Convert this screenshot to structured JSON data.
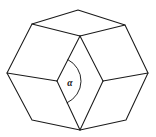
{
  "figure": {
    "kind": "line-drawing",
    "background_color": "#ffffff",
    "stroke_color": "#1a1a1a",
    "width": 156,
    "height": 137,
    "angle": {
      "symbol": "α",
      "label_x": 70,
      "label_y": 86,
      "vertex_name": "inner-left"
    },
    "vertices": {
      "top_apex": {
        "x": 78,
        "y": 10
      },
      "upper_left": {
        "x": 32,
        "y": 24
      },
      "upper_right": {
        "x": 125,
        "y": 25
      },
      "center_top": {
        "x": 80,
        "y": 36
      },
      "outer_left": {
        "x": 7,
        "y": 73
      },
      "outer_right": {
        "x": 148,
        "y": 73
      },
      "inner_left": {
        "x": 57,
        "y": 81
      },
      "inner_right": {
        "x": 103,
        "y": 81
      },
      "bottom_left": {
        "x": 32,
        "y": 120
      },
      "bottom_right": {
        "x": 126,
        "y": 120
      },
      "bottom_apex": {
        "x": 80,
        "y": 130
      }
    },
    "edges": [
      {
        "name": "top-left-upper",
        "from": "top_apex",
        "to": "upper_left"
      },
      {
        "name": "top-right-upper",
        "from": "top_apex",
        "to": "upper_right"
      },
      {
        "name": "upper-left-center",
        "from": "upper_left",
        "to": "center_top"
      },
      {
        "name": "upper-right-center",
        "from": "upper_right",
        "to": "center_top"
      },
      {
        "name": "upper-left-outer",
        "from": "upper_left",
        "to": "outer_left"
      },
      {
        "name": "upper-right-outer",
        "from": "upper_right",
        "to": "outer_right"
      },
      {
        "name": "center-inner-left",
        "from": "center_top",
        "to": "inner_left"
      },
      {
        "name": "center-inner-right",
        "from": "center_top",
        "to": "inner_right"
      },
      {
        "name": "outer-left-inner",
        "from": "outer_left",
        "to": "inner_left"
      },
      {
        "name": "outer-right-inner",
        "from": "outer_right",
        "to": "inner_right"
      },
      {
        "name": "outer-left-bottom",
        "from": "outer_left",
        "to": "bottom_left"
      },
      {
        "name": "outer-right-bottom",
        "from": "outer_right",
        "to": "bottom_right"
      },
      {
        "name": "inner-left-apex",
        "from": "inner_left",
        "to": "bottom_apex"
      },
      {
        "name": "inner-right-apex",
        "from": "inner_right",
        "to": "bottom_apex"
      },
      {
        "name": "bottom-left-apex",
        "from": "bottom_left",
        "to": "bottom_apex"
      },
      {
        "name": "bottom-right-apex",
        "from": "bottom_right",
        "to": "bottom_apex"
      }
    ]
  }
}
